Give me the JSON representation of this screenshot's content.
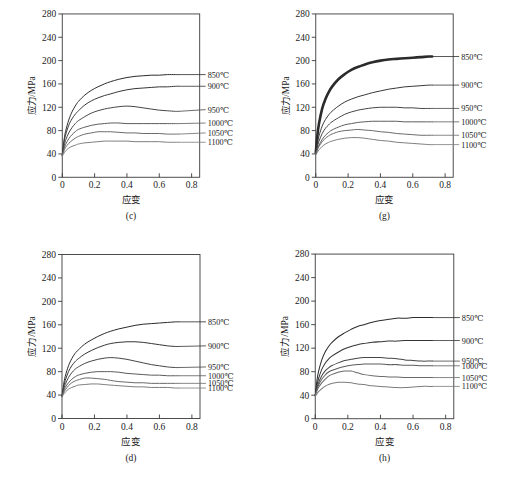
{
  "figure": {
    "background_color": "#ffffff",
    "axis_color": "#3a3a3a",
    "text_color": "#1a1a1a"
  },
  "axes": {
    "xlabel": "应变",
    "ylabel": "应力/MPa",
    "xticks": [
      "0",
      "0.2",
      "0.4",
      "0.6",
      "0.8"
    ],
    "xtick_values": [
      0,
      0.2,
      0.4,
      0.6,
      0.8
    ],
    "yticks": [
      "0",
      "40",
      "80",
      "120",
      "160",
      "200",
      "240",
      "280"
    ],
    "ytick_values": [
      0,
      40,
      80,
      120,
      160,
      200,
      240,
      280
    ],
    "xlim": [
      0,
      0.85
    ],
    "ylim": [
      0,
      280
    ]
  },
  "series_labels": [
    "850℃",
    "900℃",
    "950℃",
    "1000℃",
    "1050℃",
    "1100℃"
  ],
  "series_colors": [
    "#2b2b2b",
    "#353535",
    "#454545",
    "#5c5c5c",
    "#6a6a6a",
    "#7d7d7d"
  ],
  "chart_data": [
    {
      "type": "line",
      "panel": "(c)",
      "title": "",
      "xlabel": "应变",
      "ylabel": "应力/MPa",
      "xlim": [
        0,
        0.85
      ],
      "ylim": [
        0,
        280
      ],
      "grid": false,
      "legend_position": "right-inline",
      "x": [
        0,
        0.01,
        0.02,
        0.04,
        0.06,
        0.08,
        0.1,
        0.14,
        0.18,
        0.22,
        0.26,
        0.3,
        0.35,
        0.4,
        0.45,
        0.5,
        0.55,
        0.6,
        0.65,
        0.7,
        0.72
      ],
      "series": [
        {
          "name": "850℃",
          "label_y": 176,
          "values": [
            38,
            62,
            78,
            98,
            112,
            122,
            130,
            141,
            149,
            155,
            160,
            164,
            168,
            171,
            173,
            174,
            175,
            175,
            176,
            176,
            176
          ]
        },
        {
          "name": "900℃",
          "label_y": 156,
          "values": [
            38,
            58,
            72,
            89,
            100,
            108,
            114,
            124,
            131,
            136,
            140,
            143,
            147,
            150,
            152,
            153,
            154,
            155,
            155,
            156,
            156
          ]
        },
        {
          "name": "950℃",
          "label_y": 116,
          "values": [
            38,
            52,
            63,
            76,
            85,
            92,
            97,
            104,
            110,
            114,
            117,
            119,
            121,
            122,
            121,
            119,
            117,
            115,
            114,
            113,
            113
          ]
        },
        {
          "name": "1000℃",
          "label_y": 93,
          "values": [
            38,
            48,
            56,
            66,
            73,
            78,
            82,
            86,
            89,
            91,
            92,
            93,
            93,
            92,
            92,
            92,
            92,
            92,
            92,
            92,
            92
          ]
        },
        {
          "name": "1050℃",
          "label_y": 76,
          "values": [
            38,
            45,
            51,
            58,
            63,
            67,
            70,
            74,
            76,
            78,
            78,
            78,
            77,
            76,
            76,
            75,
            75,
            75,
            74,
            74,
            74
          ]
        },
        {
          "name": "1100℃",
          "label_y": 60,
          "values": [
            36,
            41,
            45,
            50,
            53,
            55,
            57,
            59,
            60,
            61,
            62,
            62,
            62,
            62,
            61,
            61,
            61,
            61,
            60,
            60,
            60
          ]
        }
      ]
    },
    {
      "type": "line",
      "panel": "(g)",
      "title": "",
      "xlabel": "应变",
      "ylabel": "应力/MPa",
      "xlim": [
        0,
        0.85
      ],
      "ylim": [
        0,
        280
      ],
      "grid": false,
      "legend_position": "right-inline",
      "x": [
        0,
        0.01,
        0.02,
        0.04,
        0.06,
        0.08,
        0.1,
        0.14,
        0.18,
        0.22,
        0.26,
        0.3,
        0.35,
        0.4,
        0.45,
        0.5,
        0.55,
        0.6,
        0.65,
        0.7,
        0.72
      ],
      "series": [
        {
          "name": "850℃",
          "label_y": 207,
          "values": [
            42,
            72,
            92,
            118,
            134,
            146,
            155,
            168,
            177,
            184,
            189,
            193,
            197,
            200,
            202,
            203,
            204,
            205,
            206,
            207,
            207
          ],
          "emphasis": true
        },
        {
          "name": "900℃",
          "label_y": 158,
          "values": [
            40,
            58,
            71,
            88,
            99,
            107,
            113,
            122,
            129,
            134,
            138,
            141,
            145,
            148,
            151,
            153,
            155,
            156,
            157,
            158,
            158
          ]
        },
        {
          "name": "950℃",
          "label_y": 118,
          "values": [
            40,
            52,
            62,
            75,
            84,
            90,
            95,
            102,
            108,
            112,
            115,
            117,
            119,
            120,
            120,
            120,
            119,
            119,
            118,
            118,
            118
          ]
        },
        {
          "name": "1000℃",
          "label_y": 95,
          "values": [
            40,
            48,
            55,
            65,
            72,
            77,
            81,
            86,
            90,
            92,
            94,
            95,
            96,
            96,
            96,
            96,
            95,
            95,
            95,
            95,
            95
          ]
        },
        {
          "name": "1050℃",
          "label_y": 72,
          "values": [
            40,
            47,
            53,
            61,
            67,
            71,
            74,
            78,
            80,
            81,
            82,
            81,
            80,
            78,
            77,
            75,
            74,
            73,
            72,
            72,
            72
          ]
        },
        {
          "name": "1100℃",
          "label_y": 56,
          "values": [
            38,
            43,
            47,
            53,
            57,
            60,
            62,
            65,
            67,
            68,
            68,
            67,
            65,
            63,
            62,
            60,
            59,
            58,
            57,
            56,
            56
          ]
        }
      ]
    },
    {
      "type": "line",
      "panel": "(d)",
      "title": "",
      "xlabel": "应变",
      "ylabel": "应力/MPa",
      "xlim": [
        0,
        0.85
      ],
      "ylim": [
        0,
        280
      ],
      "grid": false,
      "legend_position": "right-inline",
      "x": [
        0,
        0.01,
        0.02,
        0.04,
        0.06,
        0.08,
        0.1,
        0.14,
        0.18,
        0.22,
        0.26,
        0.3,
        0.35,
        0.4,
        0.45,
        0.5,
        0.55,
        0.6,
        0.65,
        0.7,
        0.72
      ],
      "series": [
        {
          "name": "850℃",
          "label_y": 165,
          "values": [
            38,
            58,
            72,
            90,
            102,
            111,
            117,
            127,
            134,
            140,
            145,
            149,
            153,
            156,
            159,
            161,
            162,
            163,
            164,
            165,
            165
          ]
        },
        {
          "name": "900℃",
          "label_y": 124,
          "values": [
            38,
            53,
            65,
            80,
            90,
            97,
            102,
            110,
            116,
            121,
            125,
            128,
            130,
            131,
            131,
            130,
            128,
            126,
            124,
            123,
            123
          ]
        },
        {
          "name": "950℃",
          "label_y": 88,
          "values": [
            38,
            49,
            58,
            70,
            78,
            84,
            88,
            94,
            98,
            101,
            103,
            104,
            103,
            101,
            98,
            95,
            92,
            90,
            88,
            87,
            87
          ]
        },
        {
          "name": "1000℃",
          "label_y": 73,
          "values": [
            38,
            46,
            53,
            61,
            67,
            71,
            74,
            77,
            79,
            80,
            80,
            80,
            79,
            77,
            76,
            75,
            74,
            74,
            73,
            73,
            73
          ]
        },
        {
          "name": "1050℃",
          "label_y": 60,
          "values": [
            38,
            44,
            49,
            56,
            61,
            64,
            66,
            69,
            69,
            68,
            67,
            65,
            63,
            62,
            61,
            61,
            60,
            60,
            60,
            60,
            60
          ]
        },
        {
          "name": "1100℃",
          "label_y": 52,
          "values": [
            37,
            41,
            45,
            50,
            53,
            55,
            57,
            58,
            59,
            59,
            58,
            57,
            56,
            55,
            54,
            54,
            53,
            53,
            53,
            52,
            52
          ]
        }
      ]
    },
    {
      "type": "line",
      "panel": "(h)",
      "title": "",
      "xlabel": "应变",
      "ylabel": "应力/MPa",
      "xlim": [
        0,
        0.85
      ],
      "ylim": [
        0,
        280
      ],
      "grid": false,
      "legend_position": "right-inline",
      "x": [
        0,
        0.01,
        0.02,
        0.04,
        0.06,
        0.08,
        0.1,
        0.14,
        0.18,
        0.22,
        0.26,
        0.3,
        0.35,
        0.4,
        0.45,
        0.5,
        0.55,
        0.6,
        0.65,
        0.7,
        0.72
      ],
      "series": [
        {
          "name": "850℃",
          "label_y": 172,
          "values": [
            40,
            64,
            80,
            100,
            113,
            122,
            129,
            139,
            146,
            152,
            157,
            160,
            164,
            167,
            169,
            171,
            171,
            172,
            172,
            172,
            172
          ]
        },
        {
          "name": "900℃",
          "label_y": 133,
          "values": [
            40,
            56,
            68,
            84,
            94,
            101,
            106,
            113,
            119,
            123,
            126,
            128,
            130,
            131,
            132,
            132,
            133,
            133,
            133,
            133,
            133
          ]
        },
        {
          "name": "950℃",
          "label_y": 98,
          "values": [
            40,
            52,
            61,
            73,
            81,
            86,
            90,
            95,
            99,
            101,
            103,
            104,
            104,
            104,
            103,
            102,
            100,
            99,
            98,
            98,
            98
          ]
        },
        {
          "name": "1000℃",
          "label_y": 90,
          "values": [
            40,
            49,
            57,
            67,
            74,
            79,
            82,
            86,
            89,
            91,
            92,
            93,
            93,
            93,
            92,
            92,
            91,
            91,
            90,
            90,
            90
          ]
        },
        {
          "name": "1050℃",
          "label_y": 70,
          "values": [
            40,
            47,
            53,
            61,
            67,
            72,
            75,
            79,
            81,
            81,
            78,
            75,
            73,
            72,
            71,
            71,
            70,
            70,
            70,
            70,
            70
          ]
        },
        {
          "name": "1100℃",
          "label_y": 55,
          "values": [
            38,
            42,
            46,
            51,
            55,
            58,
            60,
            62,
            62,
            61,
            59,
            58,
            56,
            55,
            54,
            53,
            53,
            54,
            55,
            55,
            55
          ]
        }
      ]
    }
  ]
}
